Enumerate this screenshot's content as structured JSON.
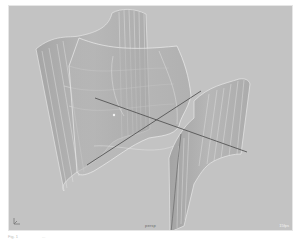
{
  "viewport": {
    "camera_label": "persp",
    "hud_label": "15fps",
    "background_color": "#c3c3c3",
    "surface_color": "#a9a9a9",
    "isoparm_color": "#e2e2e2",
    "axis_color": "#555555",
    "objects": [
      {
        "name": "nurbs-surface-left",
        "type": "curved surface"
      },
      {
        "name": "nurbs-surface-center",
        "type": "curved surface"
      },
      {
        "name": "nurbs-surface-right",
        "type": "curved surface"
      }
    ],
    "axes": [
      "x-axis",
      "z-axis"
    ]
  },
  "footer": {
    "left_text": "Fig. 1",
    "right_text": "..."
  }
}
